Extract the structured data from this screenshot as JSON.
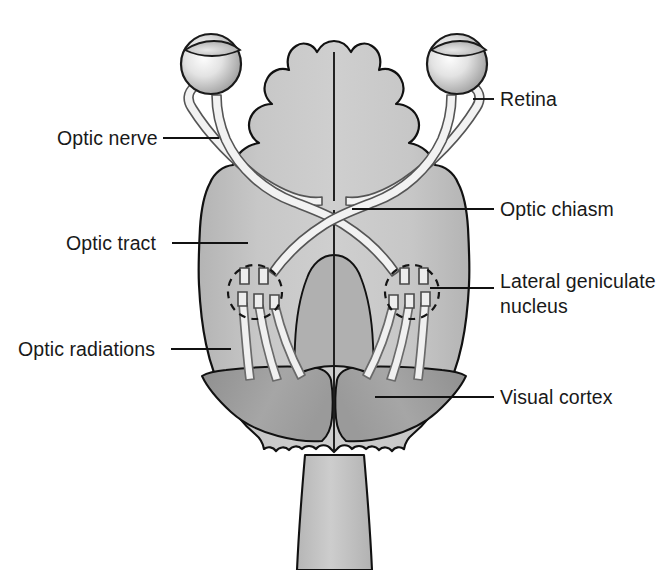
{
  "figure": {
    "background_color": "#ffffff",
    "line_color": "#111111",
    "text_color": "#191919"
  },
  "palette": {
    "brain_light": "#c9c9c9",
    "brain_mid": "#bcbcbc",
    "brain_dark": "#a3a3a3",
    "occipital": "#9a9a9a",
    "brainstem": "#c4c4c4",
    "eye_highlight": "#fbfbfb",
    "eye_shadow": "#9d9d9d",
    "fiber_fill": "#efefef",
    "fiber_stroke": "#5a5a5a",
    "outline": "#111111"
  },
  "labels": [
    {
      "id": "optic-nerve",
      "text": "Optic nerve",
      "side": "left",
      "text_x": 57,
      "text_y": 145,
      "leader": {
        "x1": 163,
        "y1": 138,
        "x2": 219,
        "y2": 138
      }
    },
    {
      "id": "retina",
      "text": "Retina",
      "side": "right",
      "text_x": 500,
      "text_y": 106,
      "leader": {
        "x1": 473,
        "y1": 99,
        "x2": 494,
        "y2": 99
      }
    },
    {
      "id": "optic-tract",
      "text": "Optic tract",
      "side": "left",
      "text_x": 66,
      "text_y": 250,
      "leader": {
        "x1": 172,
        "y1": 243,
        "x2": 248,
        "y2": 243
      }
    },
    {
      "id": "optic-chiasm",
      "text": "Optic chiasm",
      "side": "right",
      "text_x": 500,
      "text_y": 216,
      "leader": {
        "x1": 352,
        "y1": 209,
        "x2": 494,
        "y2": 209
      }
    },
    {
      "id": "lateral-geniculate-nucleus",
      "text_line1": "Lateral geniculate",
      "text_line2": "nucleus",
      "side": "right",
      "text_x": 500,
      "text_y": 288,
      "line_height": 25,
      "leader": {
        "x1": 430,
        "y1": 288,
        "x2": 494,
        "y2": 288
      }
    },
    {
      "id": "optic-radiations",
      "text": "Optic radiations",
      "side": "left",
      "text_x": 18,
      "text_y": 356,
      "leader": {
        "x1": 171,
        "y1": 349,
        "x2": 231,
        "y2": 349
      }
    },
    {
      "id": "visual-cortex",
      "text": "Visual cortex",
      "side": "right",
      "text_x": 500,
      "text_y": 404,
      "leader": {
        "x1": 375,
        "y1": 397,
        "x2": 494,
        "y2": 397
      }
    }
  ],
  "anatomy": {
    "eyes": [
      {
        "id": "left-eye",
        "cx": 211,
        "cy": 64,
        "r": 30
      },
      {
        "id": "right-eye",
        "cx": 457,
        "cy": 64,
        "r": 30
      }
    ],
    "lgn": [
      {
        "id": "left-lgn",
        "cx": 255,
        "cy": 292,
        "r": 27
      },
      {
        "id": "right-lgn",
        "cx": 412,
        "cy": 292,
        "r": 27
      }
    ],
    "chiasm": {
      "cx": 334,
      "cy": 202
    },
    "midline": {
      "x": 334,
      "y1": 60,
      "y2": 430
    },
    "structures": [
      "eyeball",
      "optic-nerve",
      "optic-chiasm",
      "optic-tract",
      "lateral-geniculate-nucleus",
      "optic-radiations",
      "visual-cortex",
      "brainstem"
    ]
  }
}
